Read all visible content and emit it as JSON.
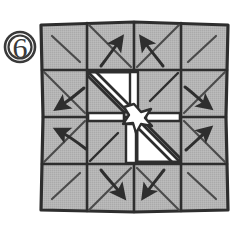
{
  "figure": {
    "kind": "origami-folding-step-diagram",
    "step_label": "6",
    "step_badge_style": "circled-number",
    "caption": "",
    "canvas": {
      "width": 236,
      "height": 236,
      "background": "#ffffff"
    }
  },
  "palette": {
    "paper_fill": "#b3b3b3",
    "paper_fill_light": "#bdbdbd",
    "open_gap_fill": "#ffffff",
    "ink": "#2e2e2e",
    "ink_soft": "#4a4a4a",
    "badge_stroke": "#3a3a3a",
    "background": "#ffffff"
  },
  "sheet": {
    "name": "folded-paper-square",
    "bounds": {
      "x": 40,
      "y": 22,
      "width": 188,
      "height": 190
    },
    "grid_columns": 4,
    "grid_rows": 4,
    "cell_width": 47,
    "cell_height": 47.5,
    "description": "square sheet divided into a 4 by 4 array of shaded panels with diagonal crease lines"
  },
  "creases": {
    "name": "diagonal-crease-lines",
    "count": 16,
    "description": "each outer panel carries one diagonal crease; the four center panels carry long diagonals running to the middle"
  },
  "center_openings": [
    {
      "name": "open-triangle-upper-left",
      "fill": "#ffffff",
      "description": "white triangular gap where paper has been pulled open, upper-left of centre"
    },
    {
      "name": "open-triangle-lower-right",
      "fill": "#ffffff",
      "description": "white triangular gap where paper has been pulled open, lower-right of centre"
    },
    {
      "name": "center-star-hub",
      "fill": "#ffffff",
      "description": "small white star-shaped hub at the exact centre where all creases converge"
    }
  ],
  "arrows": [
    {
      "id": 1,
      "name": "arrow-up-left-of-top",
      "direction": "up",
      "tip": {
        "x": 121,
        "y": 30
      },
      "note": "curved pull arrow, top-centre-left panel"
    },
    {
      "id": 2,
      "name": "arrow-up-right-of-top",
      "direction": "up",
      "tip": {
        "x": 143,
        "y": 30
      },
      "note": "curved pull arrow, top-centre-right panel"
    },
    {
      "id": 3,
      "name": "arrow-down-left-of-bottom",
      "direction": "down",
      "tip": {
        "x": 123,
        "y": 203
      },
      "note": "curved pull arrow, bottom-centre-left panel"
    },
    {
      "id": 4,
      "name": "arrow-down-right-of-bottom",
      "direction": "down",
      "tip": {
        "x": 144,
        "y": 203
      },
      "note": "curved pull arrow, bottom-centre-right panel"
    },
    {
      "id": 5,
      "name": "arrow-left-upper",
      "direction": "left",
      "tip": {
        "x": 51,
        "y": 109
      },
      "note": "curved pull arrow, left-centre-upper panel"
    },
    {
      "id": 6,
      "name": "arrow-left-lower",
      "direction": "left",
      "tip": {
        "x": 51,
        "y": 130
      },
      "note": "curved pull arrow, left-centre-lower panel"
    },
    {
      "id": 7,
      "name": "arrow-right-upper",
      "direction": "right",
      "tip": {
        "x": 215,
        "y": 108
      },
      "note": "curved pull arrow, right-centre-upper panel"
    },
    {
      "id": 8,
      "name": "arrow-right-lower",
      "direction": "right",
      "tip": {
        "x": 215,
        "y": 128
      },
      "note": "curved pull arrow, right-centre-lower panel"
    }
  ],
  "arrow_summary": {
    "total": 8,
    "up": 2,
    "down": 2,
    "left": 2,
    "right": 2
  },
  "step_badge": {
    "name": "step-number-badge",
    "text": "6",
    "center": {
      "x": 20,
      "y": 47
    },
    "radius": 15
  }
}
